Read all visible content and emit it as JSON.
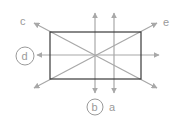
{
  "diagram": {
    "colors": {
      "rectangle": "#3a3a3a",
      "lines": "#a8a8a8",
      "labels": "#9a9a9a",
      "circles": "#9a9a9a"
    },
    "rectangle": {
      "x": 50,
      "y": 32,
      "width": 91,
      "height": 47
    },
    "lines": [
      {
        "id": "a",
        "label": "a",
        "orientation": "vertical",
        "circled": false
      },
      {
        "id": "b",
        "label": "b",
        "orientation": "vertical-center",
        "circled": true
      },
      {
        "id": "c",
        "label": "c",
        "orientation": "diagonal-top-left-to-bottom-right",
        "circled": false
      },
      {
        "id": "d",
        "label": "d",
        "orientation": "horizontal-center",
        "circled": true
      },
      {
        "id": "e",
        "label": "e",
        "orientation": "diagonal-bottom-left-to-top-right",
        "circled": false
      }
    ],
    "labels": {
      "a": "a",
      "b": "b",
      "c": "c",
      "d": "d",
      "e": "e"
    }
  }
}
